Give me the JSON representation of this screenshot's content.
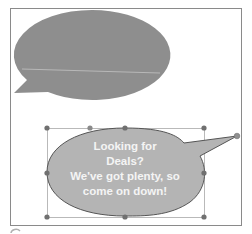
{
  "slide": {
    "name": "callout-slide"
  },
  "top_callout": {
    "shape": "oval-callout",
    "fill_color": "#8e8e8e",
    "text": ""
  },
  "selected_callout": {
    "shape": "oval-callout",
    "fill_color": "#b4b4b4",
    "outline_color": "#555555",
    "text_color": "#f4f4f4",
    "selected": true,
    "text_lines": [
      "Looking for",
      "Deals?",
      "We've got plenty, so",
      "come on down!"
    ]
  },
  "selection": {
    "handle_color": "#707070",
    "box_color": "#a0a0a0"
  }
}
